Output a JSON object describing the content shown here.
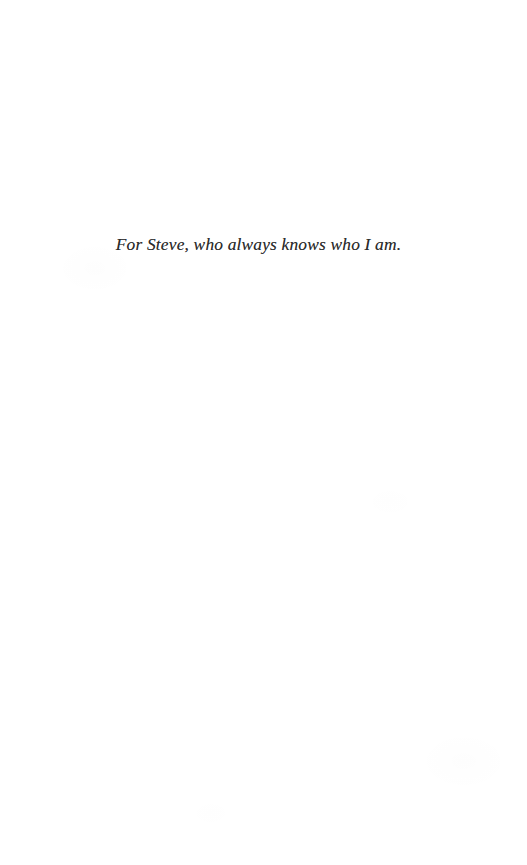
{
  "document": {
    "type": "book-dedication-page",
    "page_background_color": "#ffffff",
    "ink_color": "#2b2b2b"
  },
  "dedication": {
    "text": "For Steve, who always knows who I am.",
    "style": "italic-serif",
    "alignment": "center"
  }
}
